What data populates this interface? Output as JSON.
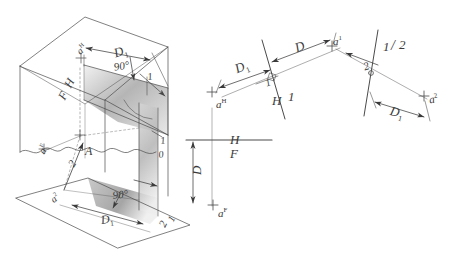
{
  "drawing": {
    "title": "Descriptive geometry construction: true distance from point A to a line",
    "background_color": "#ffffff",
    "ink_color": "#3a3a3a",
    "shade_color": "#b9b9b9"
  },
  "pictorial_view": {
    "name": "glass-box pictorial",
    "labels": [
      {
        "id": "a-h-top",
        "text": "a",
        "sup": "H",
        "x": 74,
        "y": 48,
        "size": 10,
        "rot": -42
      },
      {
        "id": "d1-top",
        "text": "D",
        "sub": "1",
        "x": 112,
        "y": 47,
        "size": 13,
        "rot": -18
      },
      {
        "id": "h-edge",
        "text": "H",
        "sup": "",
        "x": 62,
        "y": 84,
        "size": 12,
        "rot": -62
      },
      {
        "id": "f-edge",
        "text": "F",
        "sup": "",
        "x": 56,
        "y": 96,
        "size": 12,
        "rot": -62
      },
      {
        "id": "angle-top",
        "text": "90°",
        "sup": "",
        "x": 113,
        "y": 62,
        "size": 11,
        "rot": -10
      },
      {
        "id": "one-top",
        "text": "1",
        "sup": "",
        "x": 147,
        "y": 72,
        "size": 10,
        "rot": -8
      },
      {
        "id": "a-f-left",
        "text": "a",
        "sup": "F",
        "x": 36,
        "y": 150,
        "size": 10,
        "rot": -62
      },
      {
        "id": "point-a",
        "text": "A",
        "sup": "",
        "x": 85,
        "y": 145,
        "size": 12,
        "rot": 0
      },
      {
        "id": "two-arrow",
        "text": "2",
        "sup": "",
        "x": 66,
        "y": 163,
        "size": 11,
        "rot": -58
      },
      {
        "id": "one-right",
        "text": "1",
        "sup": "",
        "x": 160,
        "y": 136,
        "size": 10,
        "rot": -6
      },
      {
        "id": "zero-right",
        "text": "0",
        "sup": "",
        "x": 158,
        "y": 150,
        "size": 10,
        "rot": -8
      },
      {
        "id": "a-2-low",
        "text": "a",
        "sup": "2",
        "x": 48,
        "y": 196,
        "size": 10,
        "rot": -38
      },
      {
        "id": "angle-low",
        "text": "90°",
        "sup": "",
        "x": 112,
        "y": 190,
        "size": 11,
        "rot": -6
      },
      {
        "id": "d1-low",
        "text": "D",
        "sub": "1",
        "x": 100,
        "y": 214,
        "size": 12,
        "rot": -8
      },
      {
        "id": "two-low",
        "text": "2",
        "sup": "",
        "x": 157,
        "y": 224,
        "size": 11,
        "rot": -64
      },
      {
        "id": "one-low",
        "text": "1",
        "sup": "",
        "x": 166,
        "y": 219,
        "size": 10,
        "rot": -64
      }
    ]
  },
  "auxiliary_view": {
    "name": "auxiliary view 1 (inclined fold line H/1)",
    "labels": [
      {
        "id": "aux-d1",
        "text": "D",
        "sub": "1",
        "x": 233,
        "y": 63,
        "size": 13,
        "rot": -22
      },
      {
        "id": "aux-d",
        "text": "D",
        "sup": "",
        "x": 293,
        "y": 42,
        "size": 13,
        "rot": -20
      },
      {
        "id": "aux-a-h",
        "text": "a",
        "sup": "H",
        "x": 216,
        "y": 98,
        "size": 11,
        "rot": 0
      },
      {
        "id": "aux-h",
        "text": "H",
        "sup": "",
        "x": 272,
        "y": 94,
        "size": 13,
        "rot": 0
      },
      {
        "id": "aux-1",
        "text": "1",
        "sup": "",
        "x": 288,
        "y": 90,
        "size": 13,
        "rot": 0
      },
      {
        "id": "aux-a-1",
        "text": "a",
        "sup": "1",
        "x": 333,
        "y": 35,
        "size": 11,
        "rot": 0
      },
      {
        "id": "aux-one",
        "text": "1",
        "sup": "",
        "x": 264,
        "y": 79,
        "size": 10,
        "rot": -20
      }
    ]
  },
  "secondary_view": {
    "name": "auxiliary view 2 (fold line 1/2)",
    "labels": [
      {
        "id": "sec-1",
        "text": "1",
        "sup": "",
        "x": 383,
        "y": 40,
        "size": 13,
        "rot": 0
      },
      {
        "id": "sec-slash",
        "text": "/",
        "sup": "",
        "x": 391,
        "y": 39,
        "size": 14,
        "rot": 0
      },
      {
        "id": "sec-2",
        "text": "2",
        "sup": "",
        "x": 399,
        "y": 38,
        "size": 13,
        "rot": 0
      },
      {
        "id": "sec-two",
        "text": "2",
        "sup": "",
        "x": 362,
        "y": 62,
        "size": 11,
        "rot": -18
      },
      {
        "id": "sec-a-2",
        "text": "a",
        "sup": "2",
        "x": 428,
        "y": 94,
        "size": 11,
        "rot": -10
      },
      {
        "id": "sec-d1",
        "text": "D",
        "sub": "1",
        "x": 392,
        "y": 104,
        "size": 13,
        "rot": 14
      }
    ]
  },
  "front_view": {
    "name": "front/horizontal orthographic view",
    "labels": [
      {
        "id": "fv-h",
        "text": "H",
        "sup": "",
        "x": 230,
        "y": 133,
        "size": 13,
        "rot": 0
      },
      {
        "id": "fv-f",
        "text": "F",
        "sup": "",
        "x": 230,
        "y": 147,
        "size": 13,
        "rot": 0
      },
      {
        "id": "fv-d",
        "text": "D",
        "sup": "",
        "x": 190,
        "y": 175,
        "size": 13,
        "rot": -90
      },
      {
        "id": "fv-a-f",
        "text": "a",
        "sup": "F",
        "x": 218,
        "y": 207,
        "size": 11,
        "rot": 0
      }
    ]
  }
}
